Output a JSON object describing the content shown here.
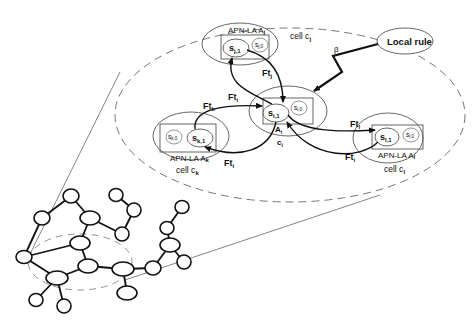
{
  "diagram": {
    "local_rule": {
      "label": "Local rule",
      "beta": "β"
    },
    "cells": {
      "center": {
        "cell_label": "c",
        "cell_sub": "i",
        "automaton": "A",
        "automaton_sub": "i",
        "state_active": "s",
        "state_active_sub": "i,1",
        "state_idle": "s",
        "state_idle_sub": "i,0"
      },
      "top": {
        "apn_label": "APN-LA A",
        "apn_sub": "j",
        "cell_label": "cell c",
        "cell_sub": "j",
        "state_active": "s",
        "state_active_sub": "j,1",
        "state_idle": "s",
        "state_idle_sub": "j,0"
      },
      "left": {
        "apn_label": "APN-LA A",
        "apn_sub": "k",
        "cell_label": "cell c",
        "cell_sub": "k",
        "state_active": "s",
        "state_active_sub": "k,1",
        "state_idle": "s",
        "state_idle_sub": "k,0"
      },
      "right": {
        "apn_label": "APN-LA A",
        "apn_sub": "l",
        "cell_label": "cell c",
        "cell_sub": "l",
        "state_active": "s",
        "state_active_sub": "l,1",
        "state_idle": "s",
        "state_idle_sub": "l,0"
      }
    },
    "arrows": {
      "ft_j": {
        "label": "Ft",
        "sub": "j"
      },
      "ft_i_top": {
        "label": "Ft",
        "sub": "i"
      },
      "ft_k": {
        "label": "Ft",
        "sub": "k"
      },
      "ft_i_left": {
        "label": "Ft",
        "sub": "i"
      },
      "ft_l": {
        "label": "Ft",
        "sub": "l"
      },
      "ft_i_right": {
        "label": "Ft",
        "sub": "i"
      }
    }
  }
}
